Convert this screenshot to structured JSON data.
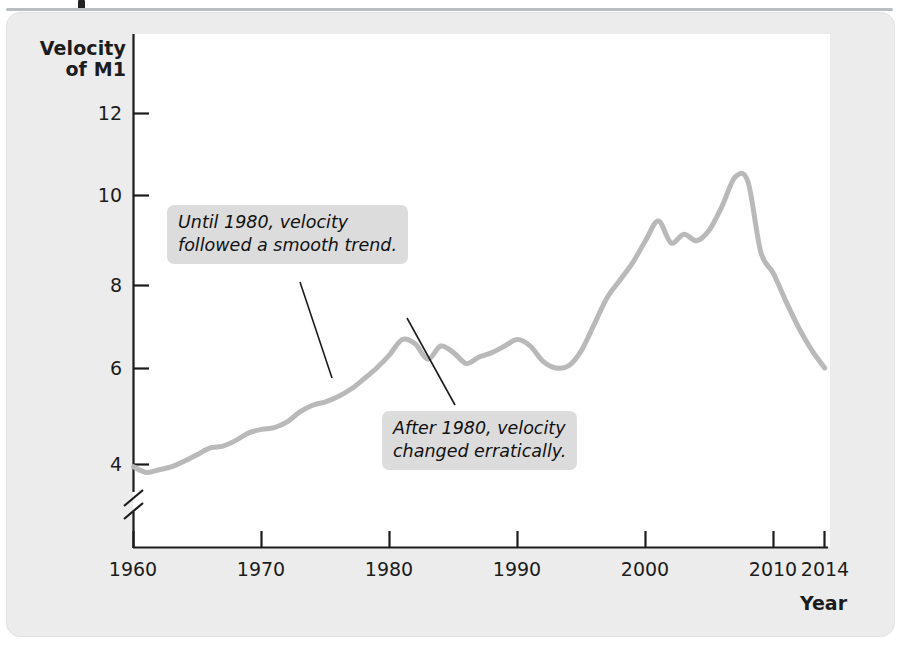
{
  "figure": {
    "y_axis_title": "Velocity\nof M1",
    "x_axis_title": "Year"
  },
  "annotations": [
    {
      "id": "annotation-0",
      "text": "Until 1980, velocity\nfollowed a smooth trend."
    },
    {
      "id": "annotation-1",
      "text": "After 1980, velocity\nchanged erratically."
    }
  ],
  "chart_data": {
    "type": "line",
    "title": "",
    "xlabel": "Year",
    "ylabel": "Velocity of M1",
    "xlim": [
      1960,
      2014
    ],
    "ylim": [
      3.2,
      12.6
    ],
    "y_axis_break": true,
    "grid": false,
    "legend": "none",
    "line_color": "#b9b9b9",
    "line_width": 5,
    "xticks": [
      1960,
      1970,
      1980,
      1990,
      2000,
      2010,
      2014
    ],
    "xtick_labels": [
      "1960",
      "1970",
      "1980",
      "1990",
      "2000",
      "2010",
      "2014"
    ],
    "yticks": [
      4,
      6,
      8,
      10,
      12
    ],
    "ytick_labels": [
      "4",
      "6",
      "8",
      "10",
      "12"
    ],
    "series": [
      {
        "name": "Velocity of M1",
        "x": [
          1960,
          1961,
          1962,
          1963,
          1964,
          1965,
          1966,
          1967,
          1968,
          1969,
          1970,
          1971,
          1972,
          1973,
          1974,
          1975,
          1976,
          1977,
          1978,
          1979,
          1980,
          1981,
          1982,
          1983,
          1984,
          1985,
          1986,
          1987,
          1988,
          1989,
          1990,
          1991,
          1992,
          1993,
          1994,
          1995,
          1996,
          1997,
          1998,
          1999,
          2000,
          2001,
          2002,
          2003,
          2004,
          2005,
          2006,
          2007,
          2008,
          2009,
          2010,
          2011,
          2012,
          2013,
          2014
        ],
        "values": [
          3.95,
          3.82,
          3.88,
          3.95,
          4.08,
          4.23,
          4.38,
          4.42,
          4.55,
          4.72,
          4.8,
          4.84,
          4.97,
          5.2,
          5.35,
          5.43,
          5.55,
          5.72,
          5.95,
          6.2,
          6.5,
          6.85,
          6.75,
          6.4,
          6.7,
          6.55,
          6.3,
          6.45,
          6.55,
          6.7,
          6.85,
          6.7,
          6.35,
          6.2,
          6.25,
          6.6,
          7.2,
          7.8,
          8.2,
          8.6,
          9.1,
          9.55,
          9.05,
          9.25,
          9.1,
          9.35,
          9.9,
          10.55,
          10.45,
          8.85,
          8.35,
          7.7,
          7.1,
          6.6,
          6.2
        ]
      }
    ],
    "peaks": [
      {
        "year": 1981,
        "value": 7.6,
        "label": "pre-1982 peak"
      },
      {
        "year": 2001,
        "value": 9.55,
        "label": "2001 local peak"
      },
      {
        "year": 2007,
        "value": 10.6,
        "label": "all-time peak"
      }
    ],
    "troughs": [
      {
        "year": 1961,
        "value": 3.8
      },
      {
        "year": 1994,
        "value": 6.2
      },
      {
        "year": 2014,
        "value": 6.15
      }
    ]
  }
}
